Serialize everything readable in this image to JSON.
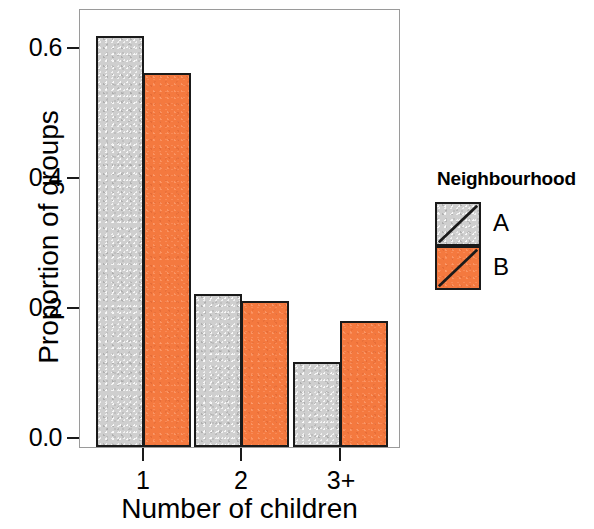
{
  "chart_data": {
    "type": "bar",
    "title": "",
    "subtitle": "",
    "xlabel": "Number of children",
    "ylabel": "Proportion of groups",
    "categories": [
      "1",
      "2",
      "3+"
    ],
    "series": [
      {
        "name": "A",
        "color": "#cfcfcf",
        "values": [
          0.635,
          0.237,
          0.131
        ]
      },
      {
        "name": "B",
        "color": "#f4793f",
        "values": [
          0.578,
          0.225,
          0.195
        ]
      }
    ],
    "ylim": [
      0.0,
      0.675
    ],
    "yticks": [
      0.0,
      0.2,
      0.4,
      0.6
    ],
    "ytick_labels": [
      "0.0",
      "0.2",
      "0.4",
      "0.6"
    ],
    "xtick_labels": [
      "1",
      "2",
      "3+"
    ],
    "grid": false,
    "legend": {
      "title": "Neighbourhood",
      "position": "right",
      "entries": [
        {
          "label": "A",
          "color": "#cfcfcf",
          "icon": "gray-swatch-with-diagonal"
        },
        {
          "label": "B",
          "color": "#f4793f",
          "icon": "orange-swatch-with-diagonal"
        }
      ]
    },
    "panel_border_color": "#9a9a9a",
    "bar_outline_color": "#1a1a1a"
  },
  "axes": {
    "y_title": "Proportion of groups",
    "x_title": "Number of children",
    "y_ticks": [
      {
        "value": "0.6",
        "pos_pct": 88.8
      },
      {
        "value": "0.4",
        "pos_pct": 59.3
      },
      {
        "value": "0.2",
        "pos_pct": 29.6
      },
      {
        "value": "0.0",
        "pos_pct": 0.0
      }
    ],
    "x_ticks": [
      {
        "label": "1",
        "center_px": 143
      },
      {
        "label": "2",
        "center_px": 241
      },
      {
        "label": "3+",
        "center_px": 340
      }
    ]
  },
  "legend": {
    "title": "Neighbourhood",
    "rows": [
      {
        "label": "A"
      },
      {
        "label": "B"
      }
    ]
  }
}
